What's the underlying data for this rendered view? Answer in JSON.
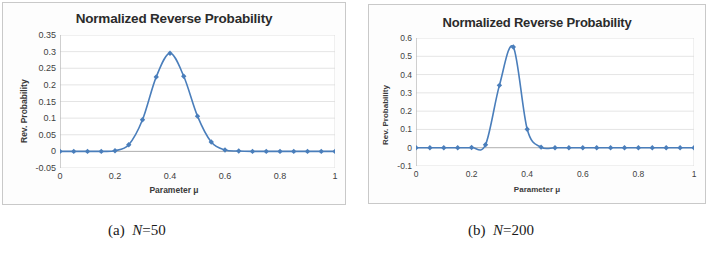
{
  "figure": {
    "background_color": "#ffffff",
    "panel_border_color": "#c9c9c9",
    "series_color": "#4a7ebb",
    "gridline_color": "#d9d9d9",
    "axis_color": "#a6a6a6"
  },
  "panels": [
    {
      "id": "panel-a",
      "title": "Normalized Reverse Probability",
      "xlabel": "Parameter μ",
      "ylabel": "Rev. Probability",
      "caption_index": "(a)",
      "caption_var": "N",
      "caption_value": "=50",
      "yticks": [
        "0.35",
        "0.3",
        "0.25",
        "0.2",
        "0.15",
        "0.1",
        "0.05",
        "0",
        "-0.05"
      ],
      "xticks": [
        "0",
        "0.2",
        "0.4",
        "0.6",
        "0.8",
        "1"
      ]
    },
    {
      "id": "panel-b",
      "title": "Normalized Reverse Probability",
      "xlabel": "Parameter μ",
      "ylabel": "Rev. Probability",
      "caption_index": "(b)",
      "caption_var": "N",
      "caption_value": "=200",
      "yticks": [
        "0.6",
        "0.5",
        "0.4",
        "0.3",
        "0.2",
        "0.1",
        "0",
        "-0.1"
      ],
      "xticks": [
        "0",
        "0.2",
        "0.4",
        "0.6",
        "0.8",
        "1"
      ]
    }
  ],
  "chart_data": [
    {
      "type": "line",
      "panel": "(a) N=50",
      "title": "Normalized Reverse Probability",
      "xlabel": "Parameter μ",
      "ylabel": "Rev. Probability",
      "xlim": [
        0,
        1
      ],
      "ylim": [
        -0.05,
        0.35
      ],
      "ytick_values": [
        -0.05,
        0,
        0.05,
        0.1,
        0.15,
        0.2,
        0.25,
        0.3,
        0.35
      ],
      "xtick_values": [
        0,
        0.2,
        0.4,
        0.6,
        0.8,
        1
      ],
      "grid": "horizontal",
      "legend": "none",
      "markers": "diamond",
      "series": [
        {
          "name": "Rev. Probability",
          "color": "#4a7ebb",
          "x": [
            0,
            0.05,
            0.1,
            0.15,
            0.2,
            0.25,
            0.3,
            0.35,
            0.4,
            0.45,
            0.5,
            0.55,
            0.6,
            0.65,
            0.7,
            0.75,
            0.8,
            0.85,
            0.9,
            0.95,
            1
          ],
          "values": [
            0,
            0,
            0,
            0,
            0.002,
            0.02,
            0.095,
            0.224,
            0.295,
            0.226,
            0.106,
            0.028,
            0.004,
            0.001,
            0,
            0,
            0,
            0,
            0,
            0,
            0
          ]
        }
      ]
    },
    {
      "type": "line",
      "panel": "(b) N=200",
      "title": "Normalized Reverse Probability",
      "xlabel": "Parameter μ",
      "ylabel": "Rev. Probability",
      "xlim": [
        0,
        1
      ],
      "ylim": [
        -0.1,
        0.6
      ],
      "ytick_values": [
        -0.1,
        0,
        0.1,
        0.2,
        0.3,
        0.4,
        0.5,
        0.6
      ],
      "xtick_values": [
        0,
        0.2,
        0.4,
        0.6,
        0.8,
        1
      ],
      "grid": "horizontal",
      "legend": "none",
      "markers": "diamond",
      "series": [
        {
          "name": "Rev. Probability",
          "color": "#4a7ebb",
          "x": [
            0,
            0.05,
            0.1,
            0.15,
            0.2,
            0.25,
            0.3,
            0.35,
            0.4,
            0.45,
            0.5,
            0.55,
            0.6,
            0.65,
            0.7,
            0.75,
            0.8,
            0.85,
            0.9,
            0.95,
            1
          ],
          "values": [
            0,
            0,
            0,
            0,
            0.001,
            0.016,
            0.341,
            0.551,
            0.101,
            0.003,
            0,
            0,
            0,
            0,
            0,
            0,
            0,
            0,
            0,
            0,
            0
          ]
        }
      ]
    }
  ]
}
